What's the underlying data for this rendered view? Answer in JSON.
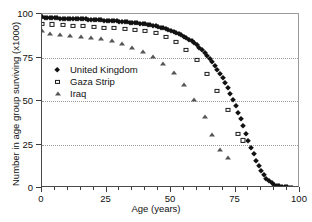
{
  "chart_data": {
    "type": "scatter",
    "title": "",
    "xlabel": "Age (years)",
    "ylabel": "Number in age group surviving  (x1000)",
    "xlim": [
      0,
      100
    ],
    "ylim": [
      0,
      100
    ],
    "xticks": [
      0,
      25,
      50,
      75,
      100
    ],
    "yticks": [
      0,
      25,
      50,
      75,
      100
    ],
    "xtick_labels": [
      "0",
      "25",
      "50",
      "75",
      "100"
    ],
    "ytick_labels": [
      "0",
      "25",
      "50",
      "75",
      "100"
    ],
    "x_minor_tick_step": 5,
    "grid": "horizontal-dotted",
    "legend_position": "upper-left-inside",
    "series": [
      {
        "name": "United Kingdom",
        "marker": "filled-diamond",
        "color": "#111111",
        "x": [
          0,
          1,
          2,
          3,
          4,
          5,
          6,
          7,
          8,
          9,
          10,
          11,
          12,
          13,
          14,
          15,
          16,
          17,
          18,
          19,
          20,
          21,
          22,
          23,
          24,
          25,
          26,
          27,
          28,
          29,
          30,
          31,
          32,
          33,
          34,
          35,
          36,
          37,
          38,
          39,
          40,
          41,
          42,
          43,
          44,
          45,
          46,
          47,
          48,
          49,
          50,
          51,
          52,
          53,
          54,
          55,
          56,
          57,
          58,
          59,
          60,
          61,
          62,
          63,
          64,
          65,
          66,
          67,
          68,
          69,
          70,
          71,
          72,
          73,
          74,
          75,
          76,
          77,
          78,
          79,
          80,
          81,
          82,
          83,
          84,
          85,
          86,
          87,
          88,
          89,
          90,
          91,
          92,
          93,
          94,
          95,
          96,
          97
        ],
        "y": [
          98.2,
          97.8,
          97.7,
          97.6,
          97.6,
          97.5,
          97.5,
          97.4,
          97.4,
          97.4,
          97.3,
          97.3,
          97.2,
          97.2,
          97.1,
          97.1,
          97.0,
          96.9,
          96.8,
          96.7,
          96.6,
          96.5,
          96.4,
          96.3,
          96.2,
          96.1,
          96.0,
          95.9,
          95.8,
          95.7,
          95.6,
          95.5,
          95.4,
          95.2,
          95.1,
          94.9,
          94.8,
          94.6,
          94.4,
          94.2,
          94.0,
          93.8,
          93.5,
          93.2,
          92.9,
          92.6,
          92.2,
          91.8,
          91.4,
          90.9,
          90.4,
          89.8,
          89.2,
          88.5,
          87.8,
          87.0,
          86.1,
          85.2,
          84.2,
          83.1,
          81.9,
          80.6,
          79.2,
          77.7,
          76.1,
          74.3,
          72.4,
          70.3,
          68.1,
          65.7,
          63.1,
          60.3,
          57.3,
          54.1,
          50.7,
          47.1,
          43.3,
          39.4,
          35.4,
          31.3,
          27.2,
          23.2,
          19.3,
          15.7,
          12.4,
          9.6,
          7.2,
          5.3,
          3.8,
          2.7,
          1.9,
          1.3,
          0.9,
          0.6,
          0.4,
          0.3,
          0.2,
          0.2
        ]
      },
      {
        "name": "Gaza Strip",
        "marker": "open-square",
        "color": "#1a1a1a",
        "x": [
          0,
          4,
          8,
          12,
          16,
          20,
          24,
          28,
          32,
          36,
          40,
          44,
          48,
          52,
          56,
          60,
          64,
          68,
          72,
          76,
          78
        ],
        "y": [
          94.2,
          94.0,
          93.6,
          93.3,
          93.0,
          92.6,
          92.2,
          91.8,
          91.4,
          90.9,
          90.2,
          89.0,
          87.0,
          83.8,
          79.4,
          73.4,
          65.5,
          55.8,
          44.8,
          31.3,
          27.4
        ]
      },
      {
        "name": "Iraq",
        "marker": "filled-triangle",
        "color": "#555555",
        "x": [
          0,
          3,
          7,
          11,
          15,
          19,
          23,
          27,
          31,
          35,
          39,
          43,
          47,
          51,
          55,
          59,
          63,
          66,
          69,
          72
        ],
        "y": [
          90.0,
          88.4,
          88.0,
          87.4,
          86.9,
          86.3,
          85.4,
          84.2,
          82.6,
          80.7,
          78.3,
          75.2,
          71.2,
          66.0,
          59.2,
          50.8,
          41.0,
          30.2,
          22.0,
          17.2
        ]
      }
    ]
  },
  "axes": {
    "xlabel": "Age (years)",
    "ylabel": "Number in age group surviving  (x1000)"
  },
  "legend": {
    "items": [
      {
        "label": "United Kingdom",
        "marker": "filled-diamond"
      },
      {
        "label": "Gaza Strip",
        "marker": "open-square"
      },
      {
        "label": "Iraq",
        "marker": "filled-triangle"
      }
    ]
  }
}
